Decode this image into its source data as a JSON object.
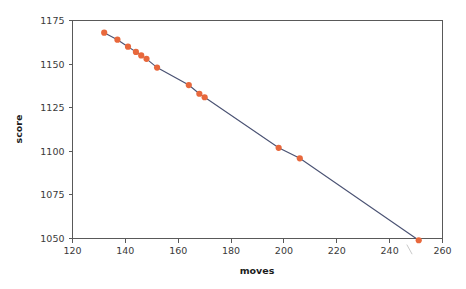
{
  "chart_data": {
    "type": "line",
    "title": "",
    "xlabel": "moves",
    "ylabel": "score",
    "xlim": [
      120,
      260
    ],
    "ylim": [
      1050,
      1175
    ],
    "xticks": [
      120,
      140,
      160,
      180,
      200,
      220,
      240,
      260
    ],
    "yticks": [
      1050,
      1075,
      1100,
      1125,
      1150,
      1175
    ],
    "grid": false,
    "legend": null,
    "markers": {
      "color": "#e8683c",
      "shape": "circle"
    },
    "line": {
      "color": "#4a5273"
    },
    "series": [
      {
        "name": "score vs moves",
        "points": [
          {
            "x": 132,
            "y": 1168
          },
          {
            "x": 137,
            "y": 1164
          },
          {
            "x": 141,
            "y": 1160
          },
          {
            "x": 144,
            "y": 1157
          },
          {
            "x": 146,
            "y": 1155
          },
          {
            "x": 148,
            "y": 1153
          },
          {
            "x": 152,
            "y": 1148
          },
          {
            "x": 164,
            "y": 1138
          },
          {
            "x": 168,
            "y": 1133
          },
          {
            "x": 170,
            "y": 1131
          },
          {
            "x": 198,
            "y": 1102
          },
          {
            "x": 206,
            "y": 1096
          },
          {
            "x": 251,
            "y": 1049
          }
        ]
      }
    ],
    "annotations": [
      {
        "name": "stray-pen-mark",
        "x1": 246.5,
        "y1": 1046.5,
        "x2": 248.5,
        "y2": 1041.0
      }
    ]
  },
  "axes": {
    "x_tick_labels": [
      "120",
      "140",
      "160",
      "180",
      "200",
      "220",
      "240",
      "260"
    ],
    "y_tick_labels": [
      "1050",
      "1075",
      "1100",
      "1125",
      "1150",
      "1175"
    ],
    "x_title": "moves",
    "y_title": "score"
  },
  "colors": {
    "marker": "#e8683c",
    "line": "#4a5273",
    "axis": "#595959",
    "text": "#3a3a3a",
    "background": "#ffffff"
  }
}
